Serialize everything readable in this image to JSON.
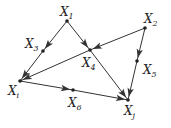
{
  "diagram": {
    "type": "directed-graph",
    "nodes": [
      {
        "id": "x1",
        "label": "X",
        "sub": "1",
        "x": 67,
        "y": 21,
        "lx": 60,
        "ly": 16
      },
      {
        "id": "x2",
        "label": "X",
        "sub": "2",
        "x": 145,
        "y": 28,
        "lx": 144,
        "ly": 23
      },
      {
        "id": "x3",
        "label": "X",
        "sub": "3",
        "x": 43,
        "y": 51,
        "lx": 25,
        "ly": 48
      },
      {
        "id": "x4",
        "label": "X",
        "sub": "4",
        "x": 90,
        "y": 50,
        "lx": 82,
        "ly": 67
      },
      {
        "id": "x5",
        "label": "X",
        "sub": "5",
        "x": 137,
        "y": 61,
        "lx": 143,
        "ly": 74
      },
      {
        "id": "xi",
        "label": "X",
        "sub": "i",
        "x": 20,
        "y": 81,
        "lx": 8,
        "ly": 95
      },
      {
        "id": "x6",
        "label": "X",
        "sub": "6",
        "x": 73,
        "y": 90,
        "lx": 68,
        "ly": 107
      },
      {
        "id": "xj",
        "label": "X",
        "sub": "j",
        "x": 128,
        "y": 100,
        "lx": 124,
        "ly": 115
      }
    ],
    "edges": [
      {
        "from": "x1",
        "to": "x3"
      },
      {
        "from": "x3",
        "to": "xi"
      },
      {
        "from": "x1",
        "to": "x4"
      },
      {
        "from": "x4",
        "to": "xj"
      },
      {
        "from": "x2",
        "to": "x4"
      },
      {
        "from": "x4",
        "to": "xi"
      },
      {
        "from": "x2",
        "to": "x5"
      },
      {
        "from": "x5",
        "to": "xj"
      },
      {
        "from": "xi",
        "to": "x6"
      },
      {
        "from": "x6",
        "to": "xj"
      }
    ]
  }
}
